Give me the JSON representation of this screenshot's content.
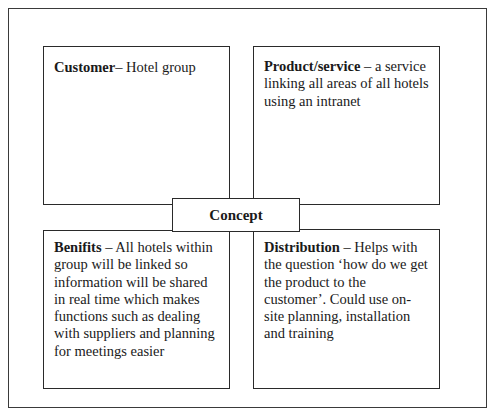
{
  "diagram": {
    "type": "concept-map",
    "center": {
      "label": "Concept"
    },
    "quadrants": {
      "customer": {
        "title": "Customer",
        "separator": "– ",
        "text": "Hotel group"
      },
      "product": {
        "title": "Product/service",
        "separator": " – ",
        "text": "a service linking all areas of all hotels using an intranet"
      },
      "benefits": {
        "title": "Benifits",
        "separator": " – ",
        "text": "All hotels within group will be linked so information will be shared in real time which makes functions such as dealing with suppliers and planning for meetings easier"
      },
      "distribution": {
        "title": "Distribution",
        "separator": " – ",
        "text": "Helps with the question ‘how do we get the product to the customer’.  Could use on-site planning, installation and training"
      }
    }
  }
}
